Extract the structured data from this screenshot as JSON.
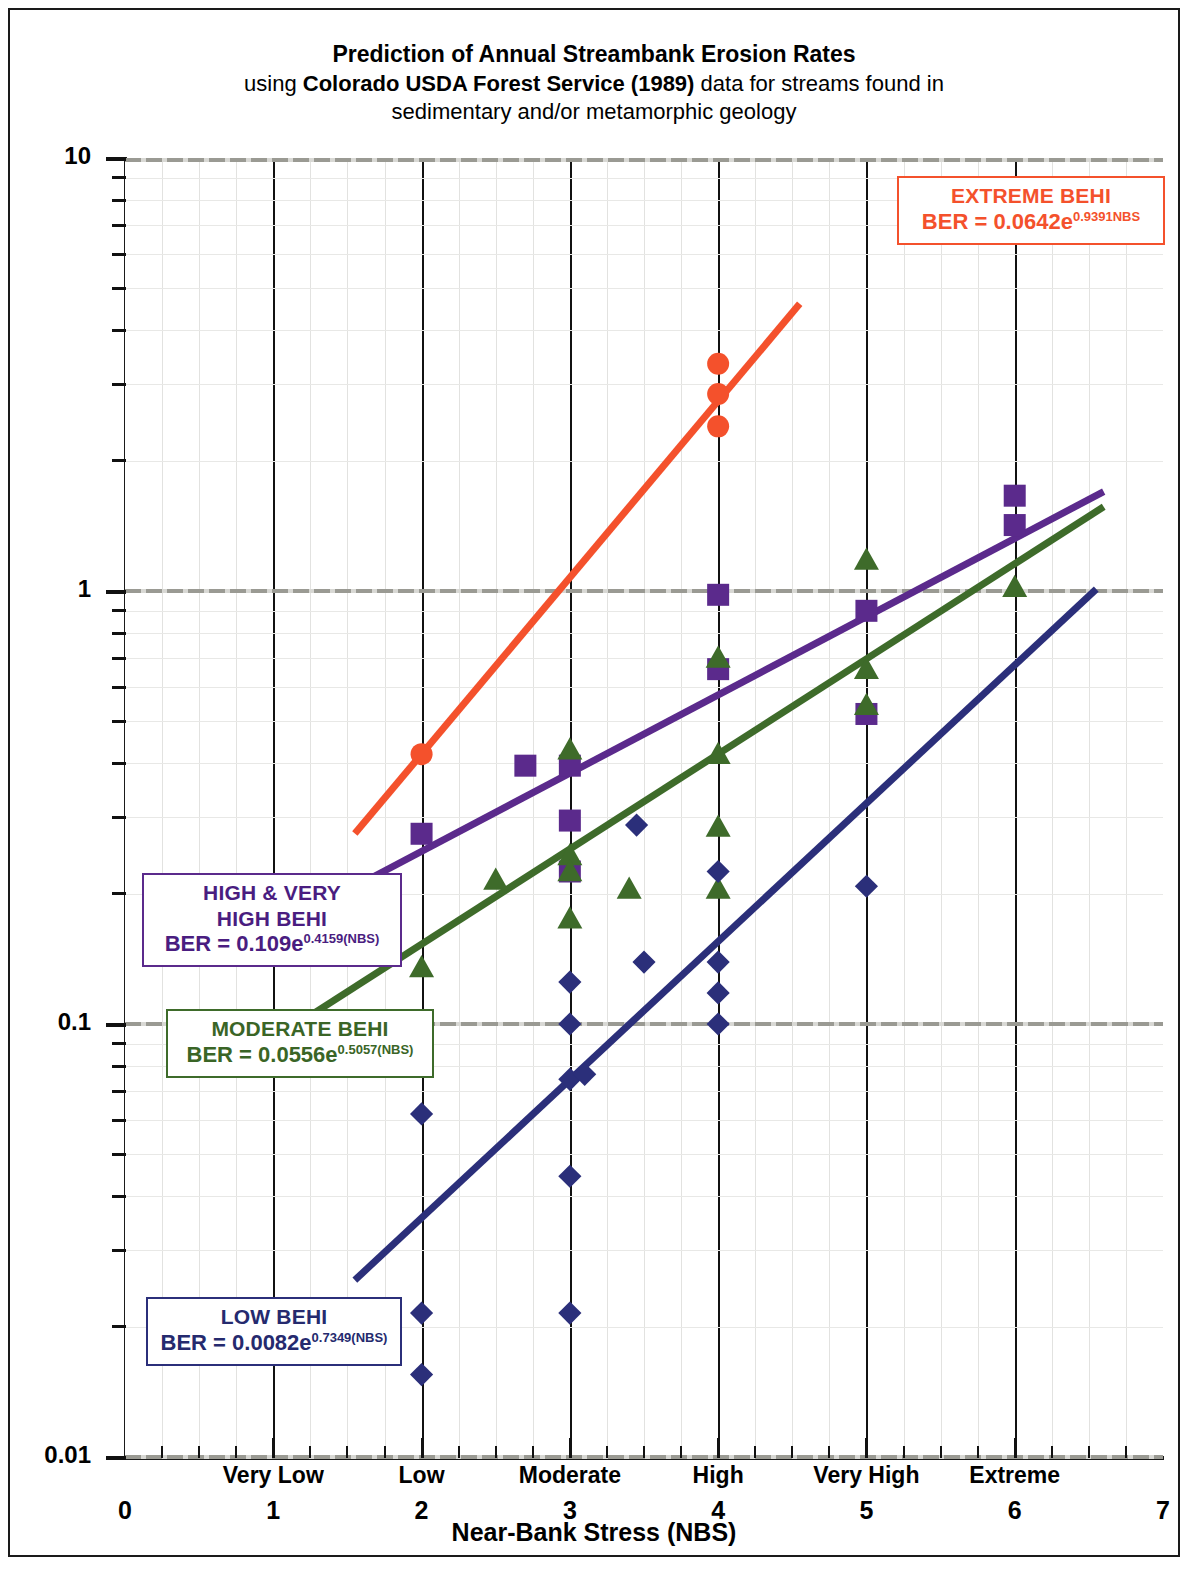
{
  "title": {
    "line1": "Prediction of Annual Streambank Erosion Rates",
    "line2_pre": "using ",
    "line2_bold": "Colorado USDA Forest Service (1989)",
    "line2_post": " data for streams found in",
    "line3": "sedimentary and/or metamorphic geology"
  },
  "axes": {
    "y_title": "Bank Erosion Rate (BER) in ft / yr",
    "x_title": "Near-Bank Stress (NBS)",
    "y_ticks": [
      "10",
      "1",
      "0.1",
      "0.01"
    ],
    "x_numbers": [
      "0",
      "1",
      "2",
      "3",
      "4",
      "5",
      "6",
      "7"
    ],
    "x_categories": [
      "Very Low",
      "Low",
      "Moderate",
      "High",
      "Very High",
      "Extreme"
    ]
  },
  "legend": {
    "extreme": {
      "title": "EXTREME BEHI",
      "eq_main": "BER = 0.0642e",
      "eq_sup": "0.9391NBS",
      "color": "#f4512c"
    },
    "high": {
      "title_line1": "HIGH & VERY",
      "title_line2": "HIGH BEHI",
      "eq_main": "BER = 0.109e",
      "eq_sup": "0.4159(NBS)",
      "color": "#5b2a8c"
    },
    "moderate": {
      "title": "MODERATE BEHI",
      "eq_main": "BER = 0.0556e",
      "eq_sup": "0.5057(NBS)",
      "color": "#3e6b2a"
    },
    "low": {
      "title": "LOW BEHI",
      "eq_main": "BER = 0.0082e",
      "eq_sup": "0.7349(NBS)",
      "color": "#2b2f7a"
    }
  },
  "caption": "",
  "chart_data": {
    "type": "scatter",
    "title": "Prediction of Annual Streambank Erosion Rates using Colorado USDA Forest Service (1989) data for streams found in sedimentary and/or metamorphic geology",
    "xlabel": "Near-Bank Stress (NBS)",
    "ylabel": "Bank Erosion Rate (BER) in ft / yr",
    "xlim": [
      0,
      7
    ],
    "ylim": [
      0.01,
      10
    ],
    "yscale": "log",
    "grid": true,
    "legend_position": "inline-boxes",
    "series": [
      {
        "name": "EXTREME BEHI",
        "marker": "circle",
        "color": "#f4512c",
        "equation": "BER = 0.0642e^(0.9391 NBS)",
        "coefficient": 0.0642,
        "exponent": 0.9391,
        "fit_x_range": [
          1.55,
          4.55
        ],
        "points": [
          {
            "x": 2.0,
            "y": 0.42
          },
          {
            "x": 4.0,
            "y": 3.35
          },
          {
            "x": 4.0,
            "y": 2.85
          },
          {
            "x": 4.0,
            "y": 2.4
          }
        ]
      },
      {
        "name": "HIGH & VERY HIGH BEHI",
        "marker": "square",
        "color": "#5b2a8c",
        "equation": "BER = 0.109e^(0.4159 NBS)",
        "coefficient": 0.109,
        "exponent": 0.4159,
        "fit_x_range": [
          1.1,
          6.6
        ],
        "points": [
          {
            "x": 2.0,
            "y": 0.275
          },
          {
            "x": 2.7,
            "y": 0.395
          },
          {
            "x": 3.0,
            "y": 0.395
          },
          {
            "x": 3.0,
            "y": 0.295
          },
          {
            "x": 3.0,
            "y": 0.225
          },
          {
            "x": 4.0,
            "y": 0.98
          },
          {
            "x": 4.0,
            "y": 0.66
          },
          {
            "x": 5.0,
            "y": 0.9
          },
          {
            "x": 5.0,
            "y": 0.52
          },
          {
            "x": 6.0,
            "y": 1.66
          },
          {
            "x": 6.0,
            "y": 1.42
          }
        ]
      },
      {
        "name": "MODERATE BEHI",
        "marker": "triangle",
        "color": "#3e6b2a",
        "equation": "BER = 0.0556e^(0.5057 NBS)",
        "coefficient": 0.0556,
        "exponent": 0.5057,
        "fit_x_range": [
          1.1,
          6.6
        ],
        "points": [
          {
            "x": 2.0,
            "y": 0.135
          },
          {
            "x": 2.5,
            "y": 0.215
          },
          {
            "x": 3.0,
            "y": 0.43
          },
          {
            "x": 3.0,
            "y": 0.245
          },
          {
            "x": 3.0,
            "y": 0.225
          },
          {
            "x": 3.0,
            "y": 0.175
          },
          {
            "x": 3.4,
            "y": 0.205
          },
          {
            "x": 4.0,
            "y": 0.7
          },
          {
            "x": 4.0,
            "y": 0.42
          },
          {
            "x": 4.0,
            "y": 0.285
          },
          {
            "x": 4.0,
            "y": 0.205
          },
          {
            "x": 5.0,
            "y": 1.18
          },
          {
            "x": 5.0,
            "y": 0.66
          },
          {
            "x": 5.0,
            "y": 0.545
          },
          {
            "x": 6.0,
            "y": 1.02
          }
        ]
      },
      {
        "name": "LOW BEHI",
        "marker": "diamond",
        "color": "#2b2f7a",
        "equation": "BER = 0.0082e^(0.7349 NBS)",
        "coefficient": 0.0082,
        "exponent": 0.7349,
        "fit_x_range": [
          1.55,
          6.55
        ],
        "points": [
          {
            "x": 2.0,
            "y": 0.062
          },
          {
            "x": 2.0,
            "y": 0.0215
          },
          {
            "x": 2.0,
            "y": 0.0155
          },
          {
            "x": 3.0,
            "y": 0.125
          },
          {
            "x": 3.0,
            "y": 0.1
          },
          {
            "x": 3.0,
            "y": 0.0745
          },
          {
            "x": 3.1,
            "y": 0.0765
          },
          {
            "x": 3.0,
            "y": 0.0445
          },
          {
            "x": 3.0,
            "y": 0.0215
          },
          {
            "x": 3.45,
            "y": 0.288
          },
          {
            "x": 3.5,
            "y": 0.139
          },
          {
            "x": 4.0,
            "y": 0.225
          },
          {
            "x": 4.0,
            "y": 0.139
          },
          {
            "x": 4.0,
            "y": 0.118
          },
          {
            "x": 4.0,
            "y": 0.1
          },
          {
            "x": 5.0,
            "y": 0.208
          }
        ]
      }
    ]
  }
}
